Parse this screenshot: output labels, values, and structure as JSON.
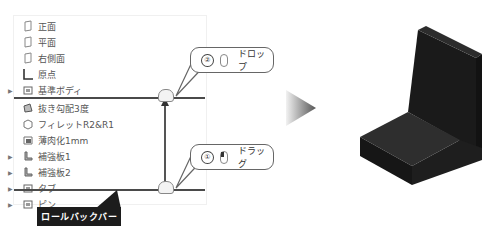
{
  "feature_tree": {
    "items": [
      {
        "label": "正面",
        "icon": "plane-icon",
        "expandable": false
      },
      {
        "label": "平面",
        "icon": "plane-icon",
        "expandable": false
      },
      {
        "label": "右側面",
        "icon": "plane-icon",
        "expandable": false
      },
      {
        "label": "原点",
        "icon": "origin-icon",
        "expandable": false
      },
      {
        "label": "基準ボディ",
        "icon": "body-icon",
        "expandable": true
      },
      {
        "label": "抜き勾配3度",
        "icon": "draft-icon",
        "expandable": false
      },
      {
        "label": "フィレットR2&R1",
        "icon": "fillet-icon",
        "expandable": false
      },
      {
        "label": "薄肉化1mm",
        "icon": "shell-icon",
        "expandable": false
      },
      {
        "label": "補強板1",
        "icon": "rib-icon",
        "expandable": true
      },
      {
        "label": "補強板2",
        "icon": "rib-icon",
        "expandable": true
      },
      {
        "label": "タブ",
        "icon": "body-icon",
        "expandable": true
      },
      {
        "label": "ピン",
        "icon": "body-icon",
        "expandable": true
      }
    ]
  },
  "callouts": {
    "drop": {
      "number": "②",
      "label": "ドロップ"
    },
    "drag": {
      "number": "①",
      "label": "ドラッグ"
    }
  },
  "rollback_label": "ロールバックバー",
  "colors": {
    "bar": "#4a4a4a",
    "model": "#1f1f1f",
    "label_bg": "#1c1c1c"
  }
}
